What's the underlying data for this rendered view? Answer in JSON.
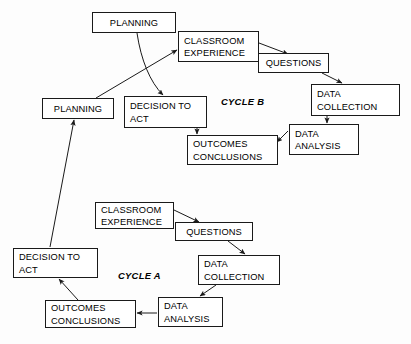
{
  "diagram": {
    "background_color": "#fdfdfd",
    "line_color": "#1a1a1a",
    "cycle_labels": [
      {
        "id": "cycle-b",
        "text": "CYCLE B",
        "x": 221,
        "y": 96
      },
      {
        "id": "cycle-a",
        "text": "CYCLE A",
        "x": 118,
        "y": 270
      }
    ],
    "nodes": [
      {
        "id": "planning-top",
        "text": "PLANNING",
        "x": 92,
        "y": 12,
        "w": 84,
        "h": 21,
        "align": "center"
      },
      {
        "id": "classroom-experience-b",
        "text": "CLASSROOM\nEXPERIENCE",
        "x": 178,
        "y": 31,
        "w": 81,
        "h": 31,
        "align": "left"
      },
      {
        "id": "questions-b",
        "text": "QUESTIONS",
        "x": 258,
        "y": 53,
        "w": 71,
        "h": 20,
        "align": "center"
      },
      {
        "id": "data-collection-b",
        "text": "DATA\nCOLLECTION",
        "x": 311,
        "y": 84,
        "w": 89,
        "h": 32,
        "align": "left"
      },
      {
        "id": "data-analysis-b",
        "text": "DATA\nANALYSIS",
        "x": 289,
        "y": 124,
        "w": 70,
        "h": 31,
        "align": "left"
      },
      {
        "id": "outcomes-conclusions-b",
        "text": "OUTCOMES\nCONCLUSIONS",
        "x": 187,
        "y": 135,
        "w": 91,
        "h": 30,
        "align": "left"
      },
      {
        "id": "planning-left",
        "text": "PLANNING",
        "x": 42,
        "y": 98,
        "w": 72,
        "h": 21,
        "align": "center"
      },
      {
        "id": "decision-to-act-b",
        "text": "DECISION TO\nACT",
        "x": 124,
        "y": 96,
        "w": 83,
        "h": 32,
        "align": "left"
      },
      {
        "id": "classroom-experience-a",
        "text": "CLASSROOM\nEXPERIENCE",
        "x": 95,
        "y": 202,
        "w": 79,
        "h": 27,
        "align": "left"
      },
      {
        "id": "questions-a",
        "text": "QUESTIONS",
        "x": 175,
        "y": 222,
        "w": 78,
        "h": 19,
        "align": "center"
      },
      {
        "id": "data-collection-a",
        "text": "DATA\nCOLLECTION",
        "x": 198,
        "y": 255,
        "w": 82,
        "h": 30,
        "align": "left"
      },
      {
        "id": "data-analysis-a",
        "text": "DATA\nANALYSIS",
        "x": 158,
        "y": 297,
        "w": 65,
        "h": 30,
        "align": "left"
      },
      {
        "id": "outcomes-conclusions-a",
        "text": "OUTCOMES\nCONCLUSIONS",
        "x": 45,
        "y": 300,
        "w": 91,
        "h": 28,
        "align": "left"
      },
      {
        "id": "decision-to-act-a",
        "text": "DECISION TO\nACT",
        "x": 13,
        "y": 248,
        "w": 85,
        "h": 30,
        "align": "left"
      }
    ],
    "edges": [
      {
        "id": "edge-classroom-b-to-questions-b",
        "from": "classroom-experience-b",
        "to": "questions-b",
        "d": "M 259 43 L 288 54",
        "arrow": true,
        "curve": false
      },
      {
        "id": "edge-questions-b-to-data-collection-b",
        "from": "questions-b",
        "to": "data-collection-b",
        "d": "M 322 73 L 342 83",
        "arrow": true,
        "curve": false
      },
      {
        "id": "edge-data-collection-b-to-analysis-b",
        "from": "data-collection-b",
        "to": "data-analysis-b",
        "d": "M 327 116 L 327 123",
        "arrow": true,
        "curve": false
      },
      {
        "id": "edge-analysis-b-to-outcomes-b",
        "from": "data-analysis-b",
        "to": "outcomes-conclusions-b",
        "d": "M 288 131 L 277 142",
        "arrow": true,
        "curve": false
      },
      {
        "id": "edge-decision-b-to-outcomes-b",
        "from": "decision-to-act-b",
        "to": "outcomes-conclusions-b",
        "d": "M 197 128 L 197 134",
        "arrow": true,
        "curve": false
      },
      {
        "id": "edge-planning-top-to-decision-b",
        "from": "planning-top",
        "to": "decision-to-act-b",
        "d": "M 137 33 C 141 60 150 82 163 95",
        "arrow": true,
        "curve": true
      },
      {
        "id": "edge-planning-left-to-classroom-b",
        "from": "planning-left",
        "to": "classroom-experience-b",
        "d": "M 96 98 L 177 50",
        "arrow": true,
        "curve": false
      },
      {
        "id": "edge-decision-a-to-planning-left",
        "from": "decision-to-act-a",
        "to": "planning-left",
        "d": "M 50 247 L 74 120",
        "arrow": true,
        "curve": false
      },
      {
        "id": "edge-classroom-a-to-questions-a",
        "from": "classroom-experience-a",
        "to": "questions-a",
        "d": "M 174 210 L 199 222",
        "arrow": true,
        "curve": false
      },
      {
        "id": "edge-questions-a-to-data-collection-a",
        "from": "questions-a",
        "to": "data-collection-a",
        "d": "M 228 241 L 245 254",
        "arrow": true,
        "curve": false
      },
      {
        "id": "edge-data-collection-a-to-analysis-a",
        "from": "data-collection-a",
        "to": "data-analysis-a",
        "d": "M 216 285 L 200 296",
        "arrow": true,
        "curve": false
      },
      {
        "id": "edge-analysis-a-to-outcomes-a",
        "from": "data-analysis-a",
        "to": "outcomes-conclusions-a",
        "d": "M 157 313 L 137 313",
        "arrow": true,
        "curve": false
      },
      {
        "id": "edge-outcomes-a-to-decision-a",
        "from": "outcomes-conclusions-a",
        "to": "decision-to-act-a",
        "d": "M 78 300 L 59 279",
        "arrow": true,
        "curve": false
      }
    ]
  }
}
